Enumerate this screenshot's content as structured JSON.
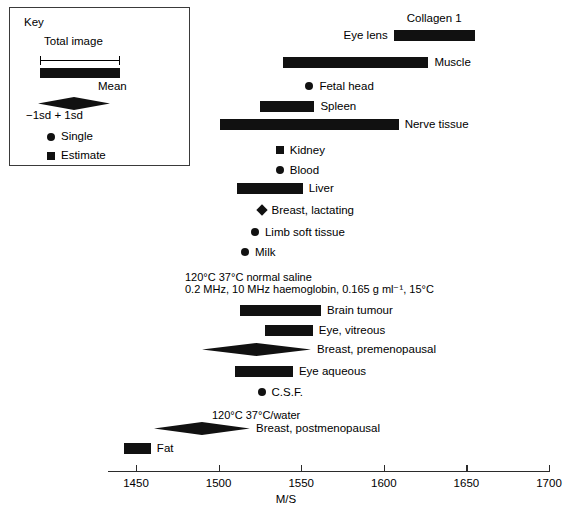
{
  "key": {
    "title": "Key",
    "total_image_label": "Total image",
    "mean_label": "Mean",
    "sd_label": "−1sd + 1sd",
    "single_label": "Single",
    "estimate_label": "Estimate",
    "single_icon": "filled-circle-icon",
    "estimate_icon": "filled-square-icon"
  },
  "axis": {
    "title": "M/S",
    "min": 1430,
    "max": 1705,
    "ticks": [
      1450,
      1500,
      1550,
      1600,
      1650,
      1700
    ],
    "tick_labels": [
      "1450",
      "1500",
      "1550",
      "1600",
      "1650",
      "1700"
    ]
  },
  "annotations": [
    {
      "id": "ann-temp-row1",
      "text": "120°C      37°C        normal saline",
      "x": 185,
      "y": 271
    },
    {
      "id": "ann-temp-row2",
      "text": "0.2 MHz, 10 MHz   haemoglobin, 0.165 g ml⁻¹, 15°C",
      "x": 185,
      "y": 283
    },
    {
      "id": "ann-temp-row3",
      "text": "120°C        37°C/water",
      "x": 212,
      "y": 409
    }
  ],
  "chart_data": {
    "type": "bar",
    "xlabel": "M/S",
    "ylabel": "",
    "xlim": [
      1430,
      1705
    ],
    "grid": false,
    "legend": [
      "Total image",
      "Mean",
      "−1sd + 1sd",
      "Single",
      "Estimate"
    ],
    "items": [
      {
        "label": "Collagen 1",
        "kind": "range",
        "low": 1606,
        "high": 1655,
        "label_side": "above",
        "y": 30
      },
      {
        "label": "Eye lens",
        "kind": "range",
        "low": 1606,
        "high": 1655,
        "label_side": "left",
        "y": 30
      },
      {
        "label": "Muscle",
        "kind": "range",
        "low": 1539,
        "high": 1627,
        "label_side": "right",
        "y": 57
      },
      {
        "label": "Fetal head",
        "kind": "single",
        "value": 1555,
        "label_side": "right",
        "y": 81
      },
      {
        "label": "Spleen",
        "kind": "range",
        "low": 1525,
        "high": 1558,
        "label_side": "right",
        "y": 101
      },
      {
        "label": "Nerve tissue",
        "kind": "range",
        "low": 1501,
        "high": 1609,
        "label_side": "right",
        "y": 119
      },
      {
        "label": "Kidney",
        "kind": "estimate",
        "value": 1537,
        "label_side": "right",
        "y": 145
      },
      {
        "label": "Blood",
        "kind": "single",
        "value": 1537,
        "label_side": "right",
        "y": 165
      },
      {
        "label": "Liver",
        "kind": "range",
        "low": 1511,
        "high": 1551,
        "label_side": "right",
        "y": 183
      },
      {
        "label": "Breast, lactating",
        "kind": "diamond",
        "value": 1526,
        "label_side": "right",
        "y": 205
      },
      {
        "label": "Limb soft tissue",
        "kind": "single",
        "value": 1522,
        "label_side": "right",
        "y": 227
      },
      {
        "label": "Milk",
        "kind": "single",
        "value": 1516,
        "label_side": "right",
        "y": 247
      },
      {
        "label": "Brain tumour",
        "kind": "range",
        "low": 1513,
        "high": 1562,
        "label_side": "right",
        "y": 305
      },
      {
        "label": "Eye, vitreous",
        "kind": "range",
        "low": 1528,
        "high": 1557,
        "label_side": "right",
        "y": 325
      },
      {
        "label": "Breast, premenopausal",
        "kind": "meansd",
        "low": 1490,
        "high": 1556,
        "value": 1523,
        "label_side": "right",
        "y": 344
      },
      {
        "label": "Eye aqueous",
        "kind": "range",
        "low": 1510,
        "high": 1545,
        "label_side": "right",
        "y": 366
      },
      {
        "label": "C.S.F.",
        "kind": "single",
        "value": 1526,
        "label_side": "right",
        "y": 387
      },
      {
        "label": "Breast, postmenopausal",
        "kind": "meansd",
        "low": 1461,
        "high": 1519,
        "value": 1490,
        "label_side": "right",
        "y": 423
      },
      {
        "label": "Fat",
        "kind": "range",
        "low": 1443,
        "high": 1459,
        "label_side": "right",
        "y": 443
      }
    ]
  }
}
